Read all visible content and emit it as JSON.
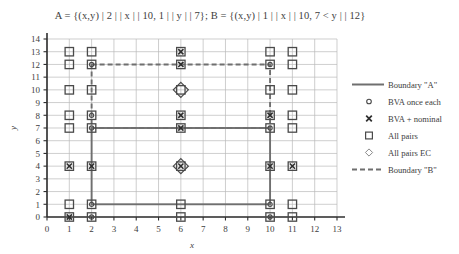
{
  "title": "A = {(x,y) | 2 | | x | | 10, 1 | | y | | 7};  B = {(x,y) | 1 | | x | | 10, 7 < y | | 12}",
  "axes": {
    "xlabel": "x",
    "ylabel": "y",
    "xticks": [
      0,
      1,
      2,
      3,
      4,
      5,
      6,
      7,
      8,
      9,
      10,
      11,
      12,
      13
    ],
    "yticks": [
      0,
      1,
      2,
      3,
      4,
      5,
      6,
      7,
      8,
      9,
      10,
      11,
      12,
      13,
      14
    ],
    "xlim": [
      0,
      13
    ],
    "ylim": [
      0,
      14
    ],
    "grid": true
  },
  "legend": {
    "position": "right",
    "items": [
      {
        "symbol": "solid-line",
        "label": "Boundary \"A\""
      },
      {
        "symbol": "circle",
        "label": "BVA once each"
      },
      {
        "symbol": "cross",
        "label": "BVA + nominal"
      },
      {
        "symbol": "square",
        "label": "All pairs"
      },
      {
        "symbol": "diamond",
        "label": "All pairs EC"
      },
      {
        "symbol": "dashed-line",
        "label": "Boundary \"B\""
      }
    ]
  },
  "chart_data": {
    "type": "scatter",
    "title": "A = {(x,y) | 2 | | x | | 10, 1 | | y | | 7};  B = {(x,y) | 1 | | x | | 10, 7 < y | | 12}",
    "xlabel": "x",
    "ylabel": "y",
    "xlim": [
      0,
      13
    ],
    "ylim": [
      0,
      14
    ],
    "grid": true,
    "legend_position": "right",
    "boundaries": [
      {
        "name": "Boundary \"A\"",
        "style": "solid",
        "color": "#6f6f6f",
        "x0": 2,
        "x1": 10,
        "y0": 1,
        "y1": 7
      },
      {
        "name": "Boundary \"B\"",
        "style": "dashed",
        "color": "#6f6f6f",
        "x0": 2,
        "x1": 10,
        "y0": 7,
        "y1": 12
      }
    ],
    "series": [
      {
        "name": "All pairs",
        "symbol": "square",
        "points": [
          [
            1,
            0
          ],
          [
            1,
            1
          ],
          [
            1,
            4
          ],
          [
            1,
            7
          ],
          [
            1,
            8
          ],
          [
            1,
            10
          ],
          [
            1,
            12
          ],
          [
            1,
            13
          ],
          [
            2,
            0
          ],
          [
            2,
            1
          ],
          [
            2,
            4
          ],
          [
            2,
            7
          ],
          [
            2,
            8
          ],
          [
            2,
            10
          ],
          [
            2,
            12
          ],
          [
            2,
            13
          ],
          [
            6,
            0
          ],
          [
            6,
            1
          ],
          [
            6,
            4
          ],
          [
            6,
            7
          ],
          [
            6,
            8
          ],
          [
            6,
            10
          ],
          [
            6,
            12
          ],
          [
            6,
            13
          ],
          [
            10,
            0
          ],
          [
            10,
            1
          ],
          [
            10,
            4
          ],
          [
            10,
            7
          ],
          [
            10,
            8
          ],
          [
            10,
            10
          ],
          [
            10,
            12
          ],
          [
            10,
            13
          ],
          [
            11,
            0
          ],
          [
            11,
            1
          ],
          [
            11,
            4
          ],
          [
            11,
            7
          ],
          [
            11,
            8
          ],
          [
            11,
            10
          ],
          [
            11,
            12
          ],
          [
            11,
            13
          ]
        ]
      },
      {
        "name": "BVA + nominal",
        "symbol": "cross",
        "points": [
          [
            1,
            0
          ],
          [
            1,
            4
          ],
          [
            2,
            4
          ],
          [
            6,
            4
          ],
          [
            6,
            7
          ],
          [
            6,
            8
          ],
          [
            6,
            12
          ],
          [
            6,
            13
          ],
          [
            10,
            4
          ],
          [
            10,
            8
          ],
          [
            11,
            4
          ]
        ]
      },
      {
        "name": "BVA once each",
        "symbol": "circle",
        "points": [
          [
            2,
            0
          ],
          [
            2,
            1
          ],
          [
            2,
            7
          ],
          [
            2,
            8
          ],
          [
            2,
            12
          ],
          [
            10,
            0
          ],
          [
            10,
            1
          ],
          [
            10,
            7
          ],
          [
            10,
            12
          ]
        ]
      },
      {
        "name": "All pairs EC",
        "symbol": "diamond",
        "points": [
          [
            6,
            4
          ],
          [
            6,
            10
          ]
        ]
      }
    ]
  }
}
